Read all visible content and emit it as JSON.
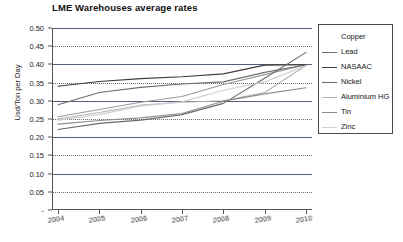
{
  "chart_data": {
    "type": "line",
    "title": "LME Warehouses average rates",
    "xlabel": "",
    "ylabel": "Usd/Ton per Day",
    "x": [
      "2004",
      "2005",
      "2006",
      "2007",
      "2008",
      "2009",
      "2010"
    ],
    "categories": [
      "2004",
      "2005",
      "2006",
      "2007",
      "2008",
      "2009",
      "2010"
    ],
    "ylim": [
      0,
      0.5
    ],
    "yticks": [
      "-",
      "0.05",
      "0.10",
      "0.15",
      "0.20",
      "0.25",
      "0.30",
      "0.35",
      "0.40",
      "0.45",
      "0.50"
    ],
    "ytick_values": [
      0,
      0.05,
      0.1,
      0.15,
      0.2,
      0.25,
      0.3,
      0.35,
      0.4,
      0.45,
      0.5
    ],
    "grid": true,
    "legend_position": "right",
    "series": [
      {
        "name": "Copper",
        "values": [
          0.256,
          0.276,
          0.296,
          0.312,
          0.345,
          0.372,
          0.399
        ],
        "color": "#9a9a9a"
      },
      {
        "name": "Lead",
        "values": [
          0.289,
          0.323,
          0.337,
          0.346,
          0.352,
          0.378,
          0.399
        ],
        "color": "#6f6f6f"
      },
      {
        "name": "NASAAC",
        "values": [
          0.34,
          0.353,
          0.361,
          0.366,
          0.374,
          0.398,
          0.399
        ],
        "color": "#3d3d3d"
      },
      {
        "name": "Nickel",
        "values": [
          0.221,
          0.238,
          0.247,
          0.262,
          0.293,
          0.362,
          0.433
        ],
        "color": "#6a6a6a"
      },
      {
        "name": "Aluminium HG",
        "values": [
          0.25,
          0.268,
          0.288,
          0.296,
          0.3,
          0.323,
          0.397
        ],
        "color": "#b3b3b3"
      },
      {
        "name": "Tin",
        "values": [
          0.236,
          0.246,
          0.253,
          0.265,
          0.299,
          0.319,
          0.336
        ],
        "color": "#8c8c8c"
      },
      {
        "name": "Zinc",
        "values": [
          0.247,
          0.262,
          0.286,
          0.297,
          0.329,
          0.352,
          0.396
        ],
        "color": "#cfcfcf"
      }
    ]
  },
  "legend": {
    "items": [
      {
        "label": "Copper"
      },
      {
        "label": "Lead"
      },
      {
        "label": "NASAAC"
      },
      {
        "label": "Nickel"
      },
      {
        "label": "Aluminium HG"
      },
      {
        "label": "Tin"
      },
      {
        "label": "Zinc"
      }
    ]
  }
}
